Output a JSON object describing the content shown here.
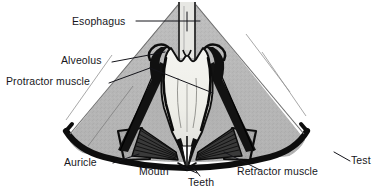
{
  "figure": {
    "style": "grayscale anatomical halftone drawing",
    "background_color": "#ffffff",
    "test_fill_color": "#b9b9b9",
    "lantern_fill_color": "#efefea",
    "outline_color": "#111111",
    "label_text_color": "#17171c"
  },
  "labels": {
    "esophagus": "Esophagus",
    "alveolus": "Alveolus",
    "protractor_muscle": "Protractor muscle",
    "auricle": "Auricle",
    "mouth": "Mouth",
    "teeth": "Teeth",
    "retractor_muscle": "Retractor muscle",
    "test": "Test"
  },
  "parts": [
    {
      "name": "esophagus",
      "description": "narrow vertical tube at top centre, pale with dark walls"
    },
    {
      "name": "alveolus",
      "description": "dark curved jaw element flanking upper lantern"
    },
    {
      "name": "protractor-muscle",
      "description": "dark diagonal band running from lantern to test wall"
    },
    {
      "name": "auricle",
      "description": "test projection at lower left arch"
    },
    {
      "name": "mouth",
      "description": "opening at bottom apex of lantern"
    },
    {
      "name": "teeth",
      "description": "converging points at bottom centre"
    },
    {
      "name": "retractor-muscle",
      "description": "striated fan of fibres at lower right"
    },
    {
      "name": "test",
      "description": "thick dark curved outer shell arc"
    }
  ]
}
